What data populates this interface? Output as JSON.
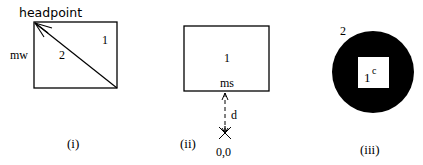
{
  "panels": [
    {
      "caption": "(i)",
      "labels": {
        "headpoint": "headpoint",
        "side": "mw",
        "region_upper": "1",
        "region_lower": "2"
      }
    },
    {
      "caption": "(ii)",
      "labels": {
        "region": "1",
        "anchor": "ms",
        "distance": "d",
        "origin": "0,0"
      }
    },
    {
      "caption": "(iii)",
      "labels": {
        "outer": "2",
        "inner": "1",
        "inner_superscript": "c"
      }
    }
  ],
  "colors": {
    "stroke": "#000000",
    "fill_dark": "#000000",
    "background": "#ffffff"
  }
}
